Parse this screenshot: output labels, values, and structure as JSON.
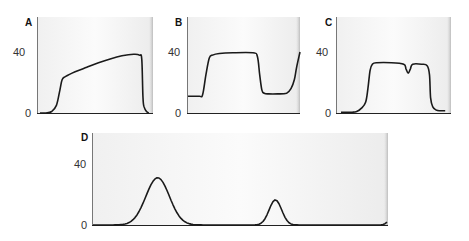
{
  "colors": {
    "background": "#ffffff",
    "panel_fill_left": "#f2f2f2",
    "panel_fill_right": "#ffffff",
    "axis": "#222222",
    "curve": "#1a1a1a",
    "tick_label": "#333333"
  },
  "chart_data": [
    {
      "panel": "A",
      "type": "line",
      "title": "A",
      "xlabel": "",
      "ylabel": "",
      "yticks": [
        0,
        40
      ],
      "ylim": [
        0,
        62
      ],
      "grid": false,
      "x": [
        0,
        5,
        10,
        14,
        17,
        19,
        22,
        30,
        40,
        50,
        60,
        70,
        80,
        85,
        87,
        88,
        89,
        91,
        93
      ],
      "values": [
        0,
        0,
        1,
        5,
        15,
        22,
        24,
        27,
        30,
        33,
        35.5,
        37.5,
        38.5,
        38,
        35,
        10,
        4,
        1,
        0
      ]
    },
    {
      "panel": "B",
      "type": "line",
      "title": "B",
      "xlabel": "",
      "ylabel": "",
      "yticks": [
        0,
        40
      ],
      "ylim": [
        0,
        62
      ],
      "grid": false,
      "x": [
        0,
        10,
        13,
        16,
        19,
        22,
        28,
        40,
        58,
        62,
        64,
        66,
        68,
        72,
        80,
        88,
        92,
        95,
        97,
        100
      ],
      "values": [
        11,
        11,
        12,
        25,
        36,
        38,
        39,
        39.5,
        39.5,
        37,
        25,
        15,
        13,
        12.5,
        12.5,
        13,
        16,
        22,
        30,
        40
      ]
    },
    {
      "panel": "C",
      "type": "line",
      "title": "C",
      "xlabel": "",
      "ylabel": "",
      "yticks": [
        0,
        40
      ],
      "ylim": [
        0,
        62
      ],
      "grid": false,
      "x": [
        0,
        10,
        14,
        18,
        22,
        24,
        26,
        28,
        32,
        45,
        56,
        58,
        60,
        62,
        64,
        72,
        77,
        79,
        80,
        82,
        85,
        88,
        93
      ],
      "values": [
        0.5,
        0.5,
        1,
        3,
        7,
        16,
        28,
        32,
        33,
        33,
        32,
        29,
        26,
        29,
        32,
        32,
        31,
        25,
        10,
        4,
        2,
        1.5,
        1.5
      ]
    },
    {
      "panel": "D",
      "type": "line",
      "title": "D",
      "xlabel": "",
      "ylabel": "",
      "yticks": [
        0,
        40
      ],
      "ylim": [
        0,
        60
      ],
      "grid": false,
      "peaks": [
        {
          "center_px": 67,
          "height": 31,
          "width_px": 32
        },
        {
          "center_px": 189,
          "height": 16.5,
          "width_px": 17
        },
        {
          "center_px": 307,
          "height": 2.5,
          "width_px": 8
        }
      ],
      "x_range_px": [
        0,
        296
      ]
    }
  ],
  "panels": [
    {
      "label": "A",
      "tick_top": "40",
      "tick_bottom": "0"
    },
    {
      "label": "B",
      "tick_top": "40",
      "tick_bottom": "0"
    },
    {
      "label": "C",
      "tick_top": "40",
      "tick_bottom": "0"
    },
    {
      "label": "D",
      "tick_top": "40",
      "tick_bottom": "0"
    }
  ]
}
